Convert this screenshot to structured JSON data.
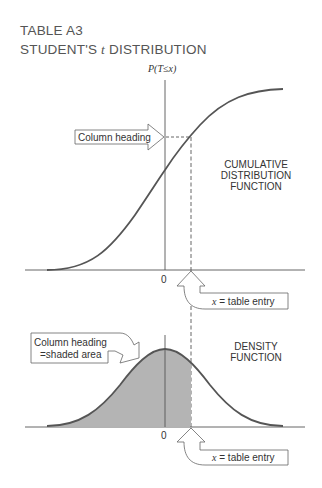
{
  "title": {
    "line1": "TABLE A3",
    "line2_prefix": "STUDENT'S ",
    "line2_var": "t",
    "line2_suffix": " DISTRIBUTION"
  },
  "cdf_panel": {
    "y_axis_label": "P(T≤x)",
    "origin_label": "0",
    "callout_column_heading": "Column heading",
    "function_label_lines": [
      "CUMULATIVE",
      "DISTRIBUTION",
      "FUNCTION"
    ],
    "callout_table_entry_var": "x",
    "callout_table_entry_text": " = table entry"
  },
  "density_panel": {
    "origin_label": "0",
    "callout_column_heading_lines": [
      "Column heading",
      "=shaded area"
    ],
    "function_label_lines": [
      "DENSITY",
      "FUNCTION"
    ],
    "callout_table_entry_var": "x",
    "callout_table_entry_text": " = table entry"
  },
  "colors": {
    "curve": "#555555",
    "axis": "#555555",
    "shaded_area": "#b4b4b4",
    "text": "#333333"
  }
}
